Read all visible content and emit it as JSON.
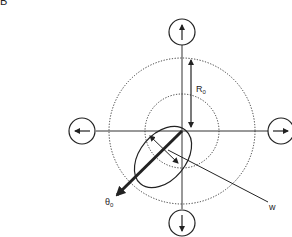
{
  "panel_label": "B",
  "labels": {
    "radius": "R",
    "radius_sub": "0",
    "theta": "θ",
    "theta_sub": "0",
    "width": "w"
  },
  "diagram": {
    "center": [
      182,
      131
    ],
    "outer_dotted_circle_radius": 73,
    "inner_dotted_circle_radius": 37,
    "direction_circles": [
      {
        "position": "top",
        "direction": "up"
      },
      {
        "position": "bottom",
        "direction": "down"
      },
      {
        "position": "left",
        "direction": "left"
      },
      {
        "position": "right",
        "direction": "right"
      }
    ],
    "colors": {
      "stroke": "#222222",
      "background": "#ffffff"
    }
  }
}
